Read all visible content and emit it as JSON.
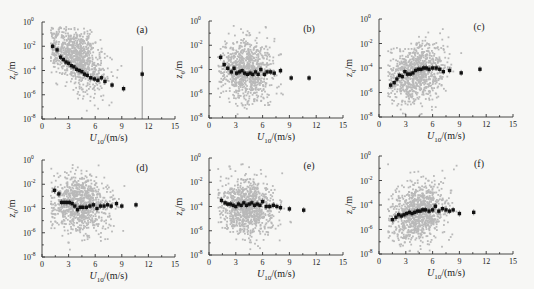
{
  "figure": {
    "layout": "2x3 grid of log-scale scatter plots",
    "colors": {
      "scatter": "#b9b9b9",
      "mean": "#111111",
      "axis": "#333333",
      "background": "#f7f7f5"
    }
  },
  "chart_data": [
    {
      "id": "a",
      "panel_label": "(a)",
      "type": "scatter",
      "xlabel": "U10/(m/s)",
      "ylabel": "z0/m",
      "xlim": [
        0,
        15
      ],
      "xticks": [
        0,
        3,
        6,
        9,
        12,
        15
      ],
      "yscale": "log",
      "ylim": [
        1e-08,
        1
      ],
      "yticks": [
        "10^0",
        "10^-2",
        "10^-4",
        "10^-6",
        "10^-8"
      ],
      "grid": false,
      "cloud": {
        "center_x": 4.0,
        "spread_x": 2.0,
        "trend": "decreasing",
        "log_y_at_x1": -1.5,
        "slope": -0.45,
        "spread_log_y": 1.2,
        "count": 900
      },
      "bin_means": {
        "x": [
          1.2,
          1.7,
          2.1,
          2.4,
          2.7,
          3.0,
          3.3,
          3.6,
          3.9,
          4.2,
          4.5,
          4.8,
          5.1,
          5.5,
          5.9,
          6.3,
          6.7,
          7.1,
          7.9,
          9.2,
          11.3
        ],
        "log10_y": [
          -2.0,
          -2.3,
          -2.9,
          -3.1,
          -3.3,
          -3.4,
          -3.6,
          -3.7,
          -3.9,
          -4.0,
          -4.1,
          -4.3,
          -4.4,
          -4.6,
          -4.7,
          -4.8,
          -4.6,
          -4.9,
          -5.2,
          -5.5,
          -4.3
        ]
      },
      "annotation": "vertical error line at U10 ≈ 11.3 extending from 10^-8 to ~10^-2"
    },
    {
      "id": "b",
      "panel_label": "(b)",
      "type": "scatter",
      "xlabel": "U10/(m/s)",
      "ylabel": "zθ/m",
      "xlim": [
        0,
        15
      ],
      "xticks": [
        0,
        3,
        6,
        9,
        12,
        15
      ],
      "yscale": "log",
      "ylim": [
        1e-08,
        1
      ],
      "yticks": [
        "10^0",
        "10^-2",
        "10^-4",
        "10^-6",
        "10^-8"
      ],
      "grid": false,
      "cloud": {
        "center_x": 4.2,
        "spread_x": 1.9,
        "trend": "flat",
        "log_y_at_x1": -4.2,
        "slope": 0.0,
        "spread_log_y": 1.3,
        "count": 850
      },
      "bin_means": {
        "x": [
          1.3,
          1.7,
          2.1,
          2.5,
          2.8,
          3.1,
          3.4,
          3.7,
          4.0,
          4.3,
          4.6,
          4.9,
          5.2,
          5.5,
          5.8,
          6.2,
          6.5,
          6.9,
          7.3,
          8.0,
          9.2,
          11.2
        ],
        "log10_y": [
          -3.0,
          -3.6,
          -3.9,
          -4.2,
          -3.9,
          -4.3,
          -4.2,
          -4.1,
          -4.3,
          -4.4,
          -4.3,
          -4.4,
          -4.2,
          -4.4,
          -4.0,
          -4.4,
          -4.2,
          -4.2,
          -4.3,
          -4.1,
          -4.7,
          -4.7
        ]
      }
    },
    {
      "id": "c",
      "panel_label": "(c)",
      "type": "scatter",
      "xlabel": "U10/(m/s)",
      "ylabel": "zq/m",
      "xlim": [
        0,
        15
      ],
      "xticks": [
        0,
        3,
        6,
        9,
        12,
        15
      ],
      "yscale": "log",
      "ylim": [
        1e-08,
        1
      ],
      "yticks": [
        "10^0",
        "10^-2",
        "10^-4",
        "10^-6",
        "10^-8"
      ],
      "grid": false,
      "cloud": {
        "center_x": 4.3,
        "spread_x": 1.9,
        "trend": "slightly increasing",
        "log_y_at_x1": -5.0,
        "slope": 0.18,
        "spread_log_y": 1.2,
        "count": 850
      },
      "bin_means": {
        "x": [
          1.3,
          1.7,
          2.0,
          2.3,
          2.6,
          2.9,
          3.2,
          3.5,
          3.8,
          4.1,
          4.4,
          4.7,
          5.0,
          5.3,
          5.6,
          6.0,
          6.4,
          6.8,
          7.2,
          7.9,
          9.2,
          11.3
        ],
        "log10_y": [
          -5.4,
          -5.2,
          -4.9,
          -4.6,
          -4.7,
          -4.3,
          -4.5,
          -4.5,
          -4.4,
          -4.2,
          -4.1,
          -4.1,
          -4.0,
          -4.0,
          -4.1,
          -4.0,
          -4.0,
          -4.1,
          -4.3,
          -4.2,
          -4.4,
          -4.1
        ]
      }
    },
    {
      "id": "d",
      "panel_label": "(d)",
      "type": "scatter",
      "xlabel": "U10/(m/s)",
      "ylabel": "z0/m",
      "xlim": [
        0,
        15
      ],
      "xticks": [
        0,
        3,
        6,
        9,
        12,
        15
      ],
      "yscale": "log",
      "ylim": [
        1e-08,
        1
      ],
      "yticks": [
        "10^0",
        "10^-2",
        "10^-4",
        "10^-6",
        "10^-8"
      ],
      "grid": false,
      "cloud": {
        "center_x": 4.2,
        "spread_x": 2.0,
        "trend": "flat",
        "log_y_at_x1": -3.4,
        "slope": -0.08,
        "spread_log_y": 1.2,
        "count": 900
      },
      "bin_means": {
        "x": [
          1.4,
          1.9,
          2.2,
          2.5,
          2.8,
          3.1,
          3.4,
          3.7,
          4.0,
          4.3,
          4.6,
          5.0,
          5.4,
          5.8,
          6.2,
          6.6,
          7.0,
          7.4,
          7.8,
          8.4,
          9.0,
          10.6
        ],
        "log10_y": [
          -2.5,
          -2.8,
          -3.5,
          -3.5,
          -3.5,
          -3.5,
          -3.6,
          -3.8,
          -4.1,
          -3.9,
          -3.9,
          -3.9,
          -3.8,
          -3.7,
          -4.0,
          -3.8,
          -3.8,
          -3.7,
          -3.8,
          -3.6,
          -3.8,
          -3.7
        ]
      }
    },
    {
      "id": "e",
      "panel_label": "(e)",
      "type": "scatter",
      "xlabel": "U10/(m/s)",
      "ylabel": "zθ/m",
      "xlim": [
        0,
        15
      ],
      "xticks": [
        0,
        3,
        6,
        9,
        12,
        15
      ],
      "yscale": "log",
      "ylim": [
        1e-08,
        1
      ],
      "yticks": [
        "10^0",
        "10^-2",
        "10^-4",
        "10^-6",
        "10^-8"
      ],
      "grid": false,
      "cloud": {
        "center_x": 4.3,
        "spread_x": 1.9,
        "trend": "flat",
        "log_y_at_x1": -4.0,
        "slope": -0.02,
        "spread_log_y": 1.2,
        "count": 900
      },
      "bin_means": {
        "x": [
          1.4,
          1.8,
          2.1,
          2.4,
          2.7,
          3.0,
          3.3,
          3.6,
          3.9,
          4.2,
          4.5,
          4.8,
          5.1,
          5.4,
          5.7,
          6.0,
          6.4,
          6.8,
          7.2,
          7.6,
          8.0,
          9.0,
          10.6
        ],
        "log10_y": [
          -3.5,
          -3.7,
          -3.8,
          -3.8,
          -3.9,
          -4.0,
          -3.8,
          -3.9,
          -3.7,
          -3.9,
          -3.8,
          -3.7,
          -3.9,
          -3.8,
          -3.9,
          -3.6,
          -4.0,
          -4.0,
          -3.9,
          -4.0,
          -4.1,
          -4.2,
          -4.3
        ]
      }
    },
    {
      "id": "f",
      "panel_label": "(f)",
      "type": "scatter",
      "xlabel": "U10/(m/s)",
      "ylabel": "zq/m",
      "xlim": [
        0,
        15
      ],
      "xticks": [
        0,
        3,
        6,
        9,
        12,
        15
      ],
      "yscale": "log",
      "ylim": [
        1e-08,
        1
      ],
      "yticks": [
        "10^0",
        "10^-2",
        "10^-4",
        "10^-6",
        "10^-8"
      ],
      "grid": false,
      "cloud": {
        "center_x": 4.4,
        "spread_x": 1.9,
        "trend": "slightly increasing",
        "log_y_at_x1": -5.0,
        "slope": 0.12,
        "spread_log_y": 1.2,
        "count": 900
      },
      "bin_means": {
        "x": [
          1.5,
          1.9,
          2.2,
          2.5,
          2.8,
          3.1,
          3.4,
          3.7,
          4.0,
          4.3,
          4.6,
          4.9,
          5.2,
          5.6,
          6.0,
          6.3,
          6.7,
          7.1,
          7.5,
          7.9,
          8.3,
          9.0,
          10.6
        ],
        "log10_y": [
          -5.2,
          -5.0,
          -4.8,
          -4.9,
          -4.8,
          -4.7,
          -4.6,
          -4.7,
          -4.6,
          -4.5,
          -4.5,
          -4.4,
          -4.4,
          -4.5,
          -4.4,
          -4.1,
          -4.5,
          -4.3,
          -4.4,
          -4.5,
          -4.4,
          -4.7,
          -4.6
        ]
      }
    }
  ],
  "panels_layout": [
    {
      "id": "a",
      "x0": 42,
      "x1": 175,
      "y_top": 22,
      "y_bottom": 119
    },
    {
      "id": "b",
      "x0": 209,
      "x1": 343,
      "y_top": 21,
      "y_bottom": 118
    },
    {
      "id": "c",
      "x0": 379,
      "x1": 513,
      "y_top": 19,
      "y_bottom": 117
    },
    {
      "id": "d",
      "x0": 42,
      "x1": 175,
      "y_top": 160,
      "y_bottom": 257
    },
    {
      "id": "e",
      "x0": 209,
      "x1": 343,
      "y_top": 158,
      "y_bottom": 255
    },
    {
      "id": "f",
      "x0": 379,
      "x1": 513,
      "y_top": 156,
      "y_bottom": 254
    }
  ]
}
